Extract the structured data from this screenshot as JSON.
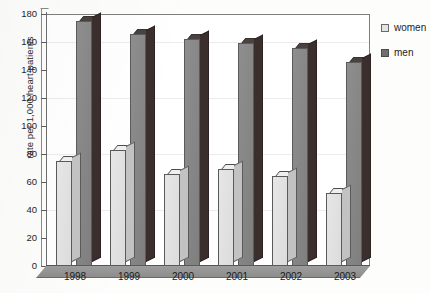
{
  "chart_data": {
    "type": "bar",
    "title": "",
    "subtitle": "",
    "xlabel": "",
    "ylabel": "rate per 1,000 heart patients",
    "categories": [
      "1998",
      "1999",
      "2000",
      "2001",
      "2002",
      "2003"
    ],
    "series": [
      {
        "name": "women",
        "color": "#e3e3e3",
        "values": [
          75,
          83,
          66,
          69,
          64,
          52
        ]
      },
      {
        "name": "men",
        "color": "#6f6f6f",
        "values": [
          175,
          166,
          162,
          159,
          156,
          146
        ]
      }
    ],
    "ylim": [
      0,
      180
    ],
    "ytick_values": [
      0,
      20,
      40,
      60,
      80,
      100,
      120,
      140,
      160,
      180
    ],
    "ytick_labels": [
      "0",
      "20",
      "40",
      "60",
      "80",
      "100",
      "120",
      "140",
      "160",
      "180"
    ],
    "grid": false,
    "legend_position": "right-top",
    "style": "3d-column"
  },
  "legend": {
    "items": [
      {
        "label": "women",
        "swatch": "light-gray-swatch"
      },
      {
        "label": "men",
        "swatch": "dark-gray-swatch"
      }
    ]
  }
}
